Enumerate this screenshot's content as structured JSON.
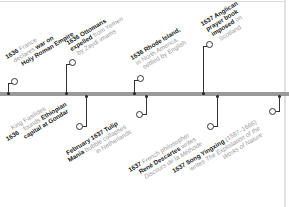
{
  "timeline": {
    "bar_color": "#9a9a9a",
    "events_above": [
      {
        "year": "1636",
        "lines": [
          [
            "France",
            ""
          ],
          [
            "declares",
            " war on"
          ],
          [
            "Holy Roman Empire",
            ""
          ]
        ],
        "text_bold_parts": [
          "1636",
          "war on",
          "Holy Roman Empire"
        ],
        "full_text": "1636 France declares war on Holy Roman Empire"
      },
      {
        "year": "1636",
        "full_text": "1636 Ottomans expelled from Yemen by Zaydi imams"
      },
      {
        "year": "1636",
        "full_text": "1636 Rhode Island, in North America, settled by English"
      },
      {
        "year": "1637",
        "full_text": "1637 Anglican prayer book imposed on Scotland"
      }
    ],
    "events_below": [
      {
        "year": "1636",
        "full_text": "1636 King Fasilides founds Ethiopian capital at Gondar"
      },
      {
        "year": "February 1637",
        "full_text": "February 1637 Tulip Mania bubble collapses in Netherlands"
      },
      {
        "year": "1637",
        "full_text": "1637 French philosopher René Descartes writes Discours de la Méthode"
      },
      {
        "year": "1637",
        "full_text": "1637 Song Yingxing (1587–1666) writes The Exploitation of the Works of Nature"
      }
    ]
  },
  "e1": {
    "b1": "1636",
    "t1": " France",
    "t2": "declares ",
    "b2": "war on",
    "b3": "Holy Roman Empire"
  },
  "e2": {
    "b1": "1636 Ottomans",
    "b2": "expelled",
    "t1": " from Yemen",
    "t2": "by Zaydi imams"
  },
  "e3": {
    "b1": "1636 Rhode Island,",
    "t1": "in North America,",
    "t2": "settled by English"
  },
  "e4": {
    "b1": "1637 Anglican",
    "b2": "prayer book",
    "b3": "imposed",
    "t1": " on",
    "t2": "Scotland"
  },
  "e5": {
    "b1": "1636",
    "t1": " King Fasilides",
    "t2": "founds ",
    "b2": "Ethiopian",
    "b3": "capital at Gondar"
  },
  "e6": {
    "b1": "February 1637 Tulip",
    "b2": "Mania",
    "t1": " bubble collapses",
    "t2": "in Netherlands"
  },
  "e7": {
    "b1": "1637",
    "t1": " French philosopher",
    "b2": "René Descartes",
    "t2": " writes",
    "i1": "Discours de la Méthode"
  },
  "e8": {
    "b1": "1637 Song Yingxing",
    "t1": " (1587–1666)",
    "t2": "writes ",
    "i1": "The Exploitation of the",
    "i2": "Works of Nature"
  }
}
